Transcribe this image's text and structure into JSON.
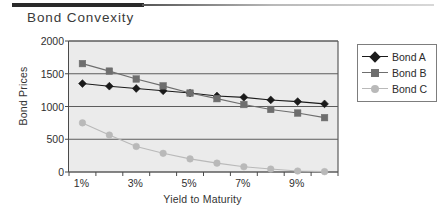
{
  "page": {
    "title": "Bond Convexity"
  },
  "chart_data": {
    "type": "line",
    "title": "Bond Convexity",
    "xlabel": "Yield to Maturity",
    "ylabel": "Bond Prices",
    "categories": [
      "1%",
      "2%",
      "3%",
      "4%",
      "5%",
      "6%",
      "7%",
      "8%",
      "9%",
      "10%"
    ],
    "xtick_labels": [
      "1%",
      "3%",
      "5%",
      "7%",
      "9%"
    ],
    "xtick_categories": [
      0,
      2,
      4,
      6,
      8
    ],
    "ytick_labels": [
      "0",
      "500",
      "1000",
      "1500",
      "2000"
    ],
    "ylim": [
      0,
      2000
    ],
    "yticks": [
      0,
      500,
      1000,
      1500,
      2000
    ],
    "grid": true,
    "legend_position": "right",
    "series": [
      {
        "name": "Bond A",
        "marker": "diamond",
        "color": "#1a1a1a",
        "values": [
          1350,
          1310,
          1275,
          1240,
          1205,
          1160,
          1140,
          1100,
          1075,
          1040
        ]
      },
      {
        "name": "Bond B",
        "marker": "square",
        "color": "#6e6e6e",
        "values": [
          1655,
          1540,
          1420,
          1315,
          1205,
          1120,
          1030,
          955,
          900,
          830
        ]
      },
      {
        "name": "Bond C",
        "marker": "circle",
        "color": "#b9b9b9",
        "values": [
          750,
          565,
          390,
          285,
          200,
          135,
          80,
          45,
          15,
          5
        ]
      }
    ]
  }
}
